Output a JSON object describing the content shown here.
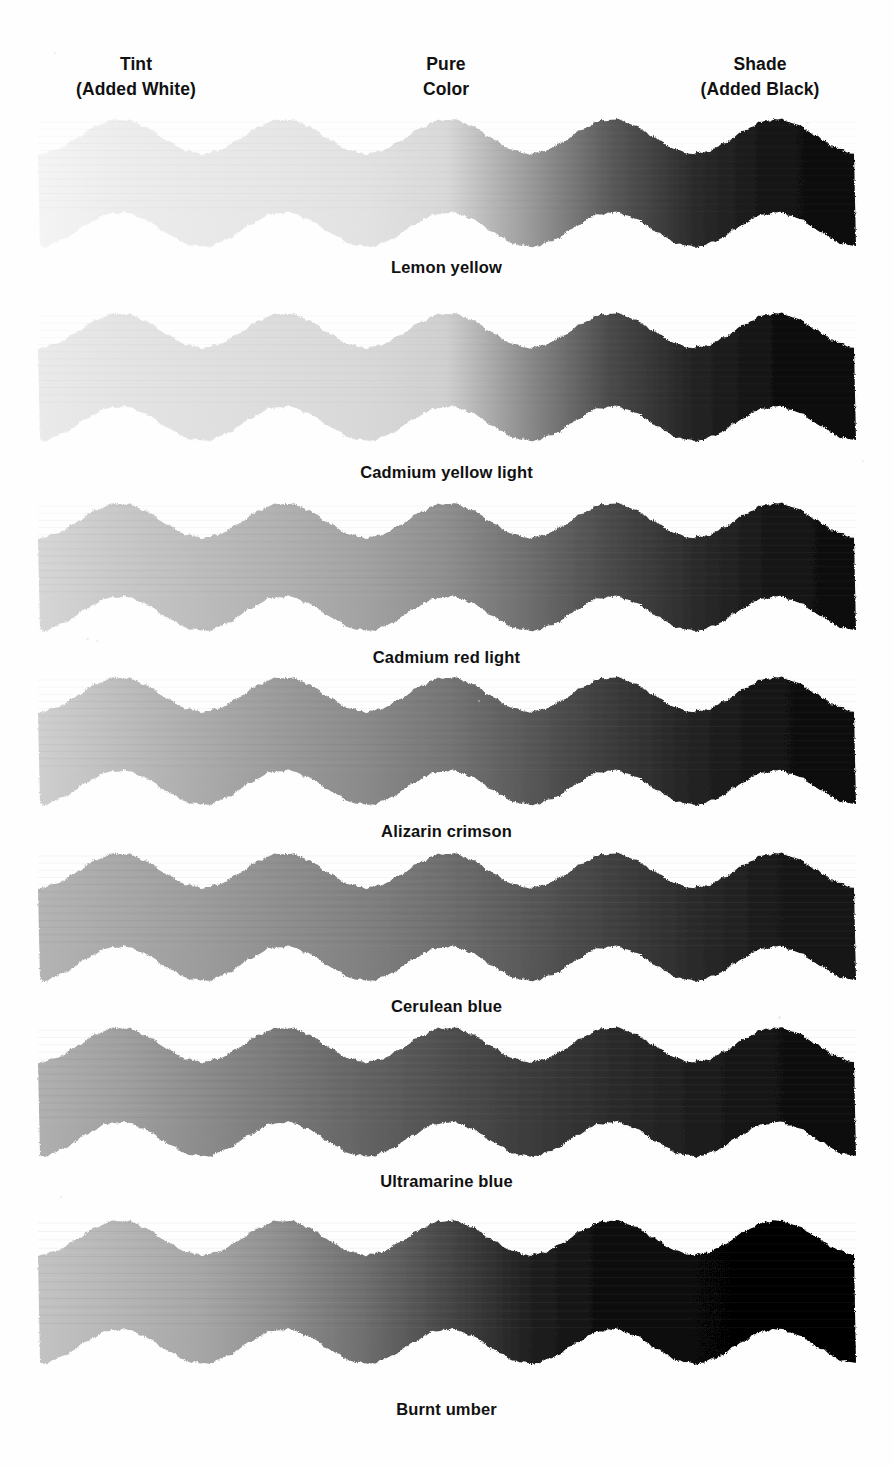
{
  "page": {
    "background": "#fefefe",
    "ink": "#111111",
    "width": 893,
    "height": 1468
  },
  "headers": [
    {
      "id": "tint",
      "line1": "Tint",
      "line2": "(Added White)",
      "center_x": 136
    },
    {
      "id": "pure",
      "line1": "Pure",
      "line2": "Color",
      "center_x": 446
    },
    {
      "id": "shade",
      "line1": "Shade",
      "line2": "(Added Black)",
      "center_x": 760
    }
  ],
  "chart_data": {
    "type": "heatmap",
    "xlabel": "",
    "ylabel": "",
    "columns": [
      "Tint (Added White)",
      "Pure Color",
      "Shade (Added Black)"
    ],
    "legend_position": "top",
    "grid": false,
    "band_geometry": {
      "left_x": 38,
      "right_x": 856,
      "wave_count": 5,
      "wave_period_px": 164,
      "amplitude_px": 17,
      "band_thickness_px": 93
    },
    "note": "Grayscale scan: each row is one pigment painted as a continuous wavy band running light (tint) to dark (shade).",
    "series": [
      {
        "name": "Lemon yellow",
        "label": "Lemon yellow",
        "top": 118,
        "band_height": 130,
        "label_y": 258,
        "stops": [
          "#f4f4f4",
          "#ededed",
          "#e9e9e9",
          "#e6e6e6",
          "#e2e2e2",
          "#d8d8d8",
          "#9b9b9b",
          "#5a5a5a",
          "#2c2c2c",
          "#141414",
          "#0c0c0c"
        ],
        "grain": 0.1
      },
      {
        "name": "Cadmium yellow light",
        "label": "Cadmium yellow light",
        "top": 312,
        "band_height": 130,
        "label_y": 463,
        "stops": [
          "#eaeaea",
          "#e4e4e4",
          "#e0e0e0",
          "#dcdcdc",
          "#d8d8d8",
          "#cfcfcf",
          "#8a8a8a",
          "#4a4a4a",
          "#242424",
          "#111111",
          "#0a0a0a"
        ],
        "grain": 0.1
      },
      {
        "name": "Cadmium red light",
        "label": "Cadmium red light",
        "top": 502,
        "band_height": 130,
        "label_y": 648,
        "stops": [
          "#d6d6d6",
          "#c8c8c8",
          "#bcbcbc",
          "#b0b0b0",
          "#a2a2a2",
          "#8e8e8e",
          "#6e6e6e",
          "#4a4a4a",
          "#2c2c2c",
          "#161616",
          "#0d0d0d"
        ],
        "grain": 0.14
      },
      {
        "name": "Alizarin crimson",
        "label": "Alizarin crimson",
        "top": 676,
        "band_height": 130,
        "label_y": 822,
        "stops": [
          "#cfcfcf",
          "#bdbdbd",
          "#ababab",
          "#9a9a9a",
          "#8a8a8a",
          "#757575",
          "#585858",
          "#3c3c3c",
          "#232323",
          "#131313",
          "#0b0b0b"
        ],
        "grain": 0.14
      },
      {
        "name": "Cerulean blue",
        "label": "Cerulean blue",
        "top": 852,
        "band_height": 130,
        "label_y": 997,
        "stops": [
          "#b4b4b4",
          "#a8a8a8",
          "#9c9c9c",
          "#8e8e8e",
          "#808080",
          "#6e6e6e",
          "#585858",
          "#414141",
          "#2b2b2b",
          "#1a1a1a",
          "#121212"
        ],
        "grain": 0.16
      },
      {
        "name": "Ultramarine blue",
        "label": "Ultramarine blue",
        "top": 1026,
        "band_height": 132,
        "label_y": 1172,
        "stops": [
          "#b0b0b0",
          "#a0a0a0",
          "#8c8c8c",
          "#787878",
          "#636363",
          "#4f4f4f",
          "#3c3c3c",
          "#2c2c2c",
          "#1e1e1e",
          "#121212",
          "#0a0a0a"
        ],
        "grain": 0.16
      },
      {
        "name": "Burnt umber",
        "label": "Burnt umber",
        "top": 1216,
        "band_height": 152,
        "label_y": 1400,
        "stops": [
          "#c3c3c3",
          "#b5b5b5",
          "#a6a6a6",
          "#8e8e8e",
          "#6e6e6e",
          "#474747",
          "#202020",
          "#0d0d0d",
          "#070707",
          "#050505",
          "#040404"
        ],
        "grain": 0.18
      }
    ]
  }
}
